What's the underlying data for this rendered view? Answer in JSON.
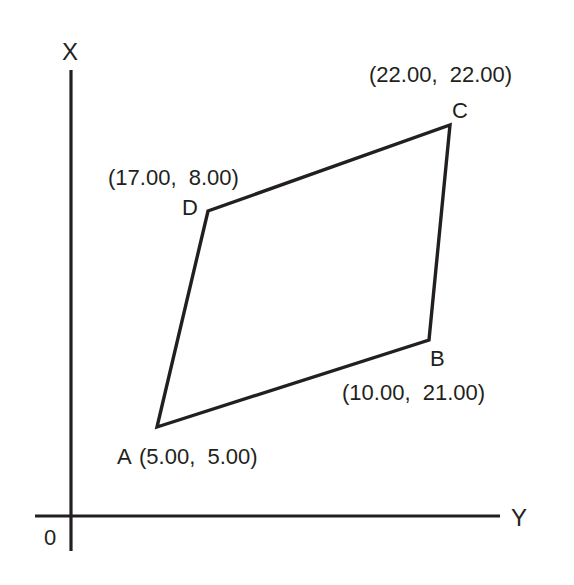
{
  "diagram": {
    "axes": {
      "vertical_label": "X",
      "horizontal_label": "Y",
      "origin_label": "0"
    },
    "quadrilateral": {
      "vertices": [
        {
          "name": "A",
          "coord_label": "(5.00,  5.00)",
          "x": 5.0,
          "y": 5.0
        },
        {
          "name": "B",
          "coord_label": "(10.00,  21.00)",
          "x": 10.0,
          "y": 21.0
        },
        {
          "name": "C",
          "coord_label": "(22.00,  22.00)",
          "x": 22.0,
          "y": 22.0
        },
        {
          "name": "D",
          "coord_label": "(17.00,  8.00)",
          "x": 17.0,
          "y": 8.0
        }
      ]
    },
    "colors": {
      "line": "#231f20",
      "background": "#ffffff"
    }
  }
}
